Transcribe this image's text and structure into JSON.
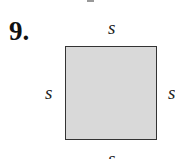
{
  "problem": {
    "number": "9."
  },
  "figure": {
    "shape": "square",
    "fill_color": "#d9d9d9",
    "stroke_color": "#333333",
    "labels": {
      "top": "s",
      "left": "s",
      "right": "s",
      "bottom": "s"
    }
  }
}
